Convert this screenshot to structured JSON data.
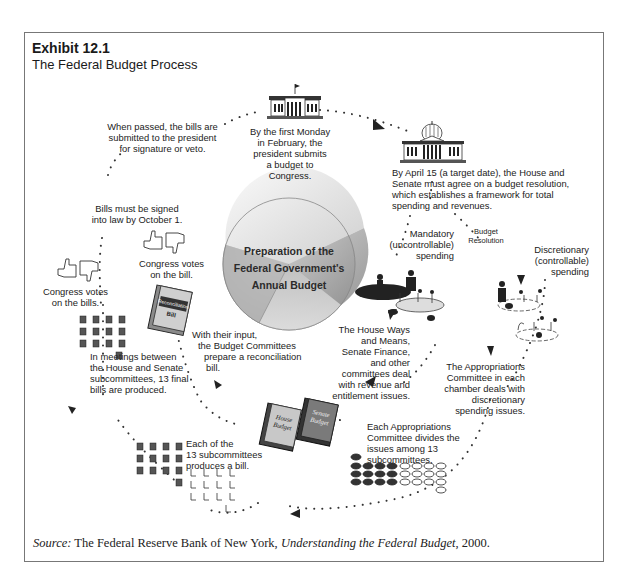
{
  "header": {
    "exhibit_number": "Exhibit 12.1",
    "title": "The Federal Budget Process"
  },
  "center": {
    "label": "Preparation of the Federal Government's Annual Budget",
    "line1": "Preparation of the",
    "line2": "Federal Government's",
    "line3": "Annual Budget"
  },
  "steps": {
    "president": [
      "By the first Monday",
      "in February, the",
      "president submits",
      "a budget to",
      "Congress."
    ],
    "resolution": [
      "By April 15 (a target date), the House and",
      "Senate must agree on a budget resolution,",
      "which establishes a framework for total",
      "spending and revenues."
    ],
    "budget_resolution_tag": [
      "Budget",
      "Resolution"
    ],
    "mandatory": [
      "Mandatory",
      "(uncontrollable)",
      "spending"
    ],
    "discretionary": [
      "Discretionary",
      "(controllable)",
      "spending"
    ],
    "ways_means": [
      "The House Ways",
      "and Means,",
      "Senate Finance,",
      "and other",
      "committees deal",
      "with revenue and",
      "entitlement issues."
    ],
    "appropriations_committee": [
      "The Appropriations",
      "Committee in each",
      "chamber deals with",
      "discretionary",
      "spending issues."
    ],
    "house_budget_book": [
      "House",
      "Budget"
    ],
    "senate_budget_book": [
      "Senate",
      "Budget"
    ],
    "divides": [
      "Each Appropriations",
      "Committee divides the",
      "issues among 13",
      "subcommittees."
    ],
    "each_sub": [
      "Each of the",
      "13 subcommittees",
      "produces a bill."
    ],
    "meetings": [
      "In meetings between",
      "the House and Senate",
      "subcommittees, 13 final",
      "bills are produced."
    ],
    "budget_committees": [
      "With their input,",
      "the Budget Committees",
      "prepare a reconciliation",
      "bill."
    ],
    "reconciliation_book": [
      "Reconciliation",
      "Bill"
    ],
    "congress_votes_bill": [
      "Congress votes",
      "on the bill."
    ],
    "congress_votes_bills": [
      "Congress votes",
      "on the bills."
    ],
    "signed": [
      "Bills must be signed",
      "into law by October 1."
    ],
    "passed": [
      "When passed, the bills are",
      "submitted to the president",
      "for signature or veto."
    ]
  },
  "source": {
    "prefix": "Source:",
    "org": " The Federal Reserve Bank of New York, ",
    "work": "Understanding the Federal Budget",
    "year": ", 2000."
  }
}
